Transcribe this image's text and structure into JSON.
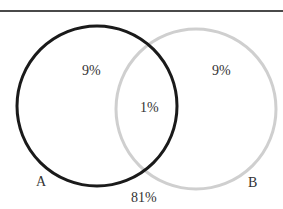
{
  "diagram": {
    "type": "venn",
    "sets": [
      {
        "name": "A",
        "label": "A",
        "color": "#1a1a1a"
      },
      {
        "name": "B",
        "label": "B",
        "color": "#cccccc"
      }
    ],
    "regions": {
      "a_only": "9%",
      "b_only": "9%",
      "a_and_b": "1%",
      "neither": "81%"
    }
  }
}
